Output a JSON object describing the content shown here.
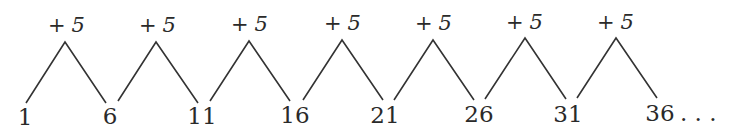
{
  "diagram": {
    "terms": [
      "1",
      "6",
      "11",
      "16",
      "21",
      "26",
      "31",
      "36"
    ],
    "ellipsis": ". . .",
    "step_operator": "+",
    "step_value": "5",
    "steps": [
      {
        "op": "+",
        "value": "5"
      },
      {
        "op": "+",
        "value": "5"
      },
      {
        "op": "+",
        "value": "5"
      },
      {
        "op": "+",
        "value": "5"
      },
      {
        "op": "+",
        "value": "5"
      },
      {
        "op": "+",
        "value": "5"
      },
      {
        "op": "+",
        "value": "5"
      }
    ],
    "colors": {
      "ink": "#2a2a2a",
      "background": "#ffffff"
    }
  }
}
